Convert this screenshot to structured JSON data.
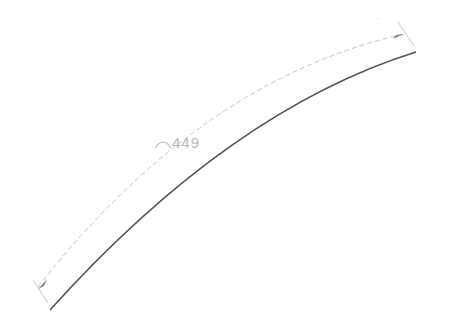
{
  "drawing": {
    "title": "",
    "dimension": {
      "type": "arc-length",
      "symbol": "arc-length-icon",
      "value": "449",
      "text_color": "#b8b8b8"
    },
    "geometry": {
      "main_arc": {
        "start": [
          50,
          310
        ],
        "control": [
          230,
          110
        ],
        "end": [
          416,
          52
        ],
        "stroke": "#555555"
      },
      "dimension_arc": {
        "start": [
          38,
          287
        ],
        "control": [
          200,
          80
        ],
        "end": [
          404,
          34
        ],
        "stroke": "#c4c4c4"
      },
      "extension_lines": [
        {
          "from": [
            48,
            303
          ],
          "to": [
            33,
            280
          ]
        },
        {
          "from": [
            414,
            46
          ],
          "to": [
            398,
            22
          ]
        }
      ],
      "arrowheads": [
        {
          "at": [
            40,
            289
          ]
        },
        {
          "at": [
            402,
            36
          ]
        }
      ]
    }
  }
}
